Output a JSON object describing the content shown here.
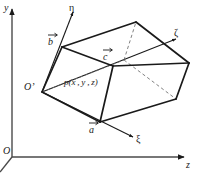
{
  "figure": {
    "background_color": "#ffffff",
    "line_color": "#1a1a1a",
    "dashed_color": "#6a6a6a",
    "axes": {
      "global": [
        {
          "id": "y-axis",
          "label": "y",
          "x": 4,
          "y": 3
        },
        {
          "id": "z-axis",
          "label": "z",
          "x": 186,
          "y": 160
        },
        {
          "id": "origin",
          "label": "O",
          "x": 3,
          "y": 146
        }
      ],
      "local": [
        {
          "id": "eta-axis",
          "label": "η",
          "x": 69,
          "y": 3
        },
        {
          "id": "zeta-axis",
          "label": "ζ",
          "x": 174,
          "y": 28
        },
        {
          "id": "xi-axis",
          "label": "ξ",
          "x": 136,
          "y": 134
        }
      ]
    },
    "vectors": [
      {
        "id": "vector-a",
        "label": "a",
        "x": 89,
        "y": 125
      },
      {
        "id": "vector-b",
        "label": "b",
        "x": 48,
        "y": 37
      },
      {
        "id": "vector-c",
        "label": "c",
        "x": 103,
        "y": 52
      }
    ],
    "points": [
      {
        "id": "local-origin",
        "label": "O’",
        "x": 24,
        "y": 82
      },
      {
        "id": "point-p",
        "label": "p(x , y , z)",
        "x": 64,
        "y": 78
      }
    ]
  }
}
